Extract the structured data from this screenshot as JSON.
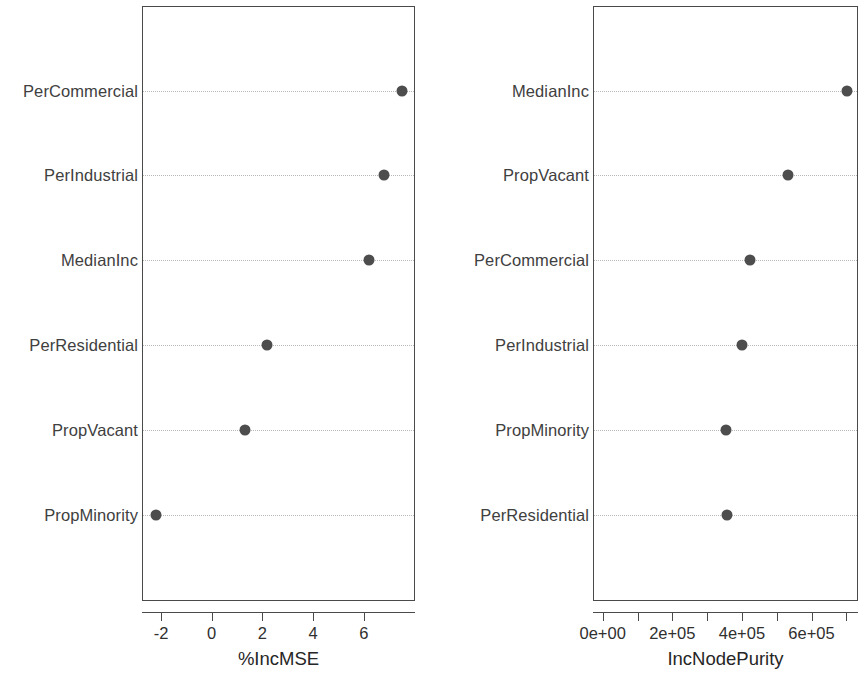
{
  "chart_data": [
    {
      "type": "scatter",
      "panel": "left",
      "title": "",
      "xlabel": "%IncMSE",
      "ylabel": "",
      "orientation": "horizontal-dotchart",
      "grid": "dotted-horizontal",
      "legend": "none",
      "xlim": [
        -2.9,
        8.2
      ],
      "xticks": [
        -2,
        0,
        2,
        4,
        6
      ],
      "xticklabels": [
        "-2",
        "0",
        "2",
        "4",
        "6"
      ],
      "categories": [
        "PerCommercial",
        "PerIndustrial",
        "MedianInc",
        "PerResidential",
        "PropVacant",
        "PropMinority"
      ],
      "values": [
        7.5,
        6.8,
        6.2,
        2.2,
        1.3,
        -2.2
      ]
    },
    {
      "type": "scatter",
      "panel": "right",
      "title": "",
      "xlabel": "IncNodePurity",
      "ylabel": "",
      "orientation": "horizontal-dotchart",
      "grid": "dotted-horizontal",
      "legend": "none",
      "xlim": [
        -28000,
        734000
      ],
      "xticks": [
        0,
        100000,
        200000,
        300000,
        400000,
        500000,
        600000,
        700000
      ],
      "xticklabels": [
        "0e+00",
        "",
        "2e+05",
        "",
        "4e+05",
        "",
        "6e+05",
        ""
      ],
      "categories": [
        "MedianInc",
        "PropVacant",
        "PerCommercial",
        "PerIndustrial",
        "PropMinority",
        "PerResidential"
      ],
      "values": [
        701000,
        533000,
        424000,
        401000,
        355000,
        358000
      ]
    }
  ],
  "left_panel": {
    "axis_title": "%IncMSE",
    "tick_labels": [
      "-2",
      "0",
      "2",
      "4",
      "6"
    ],
    "rows": [
      {
        "label": "PerCommercial",
        "value": 7.5
      },
      {
        "label": "PerIndustrial",
        "value": 6.8
      },
      {
        "label": "MedianInc",
        "value": 6.2
      },
      {
        "label": "PerResidential",
        "value": 2.2
      },
      {
        "label": "PropVacant",
        "value": 1.3
      },
      {
        "label": "PropMinority",
        "value": -2.2
      }
    ]
  },
  "right_panel": {
    "axis_title": "IncNodePurity",
    "tick_labels": [
      "0e+00",
      "2e+05",
      "4e+05",
      "6e+05"
    ],
    "rows": [
      {
        "label": "MedianInc",
        "value": 701000
      },
      {
        "label": "PropVacant",
        "value": 533000
      },
      {
        "label": "PerCommercial",
        "value": 424000
      },
      {
        "label": "PerIndustrial",
        "value": 401000
      },
      {
        "label": "PropMinority",
        "value": 355000
      },
      {
        "label": "PerResidential",
        "value": 358000
      }
    ]
  },
  "style": {
    "dot_color": "#4d4d4d",
    "frame_color": "#4a4a4a",
    "guide_color": "#b9b9b9",
    "text_color": "#333333",
    "background": "#ffffff"
  }
}
